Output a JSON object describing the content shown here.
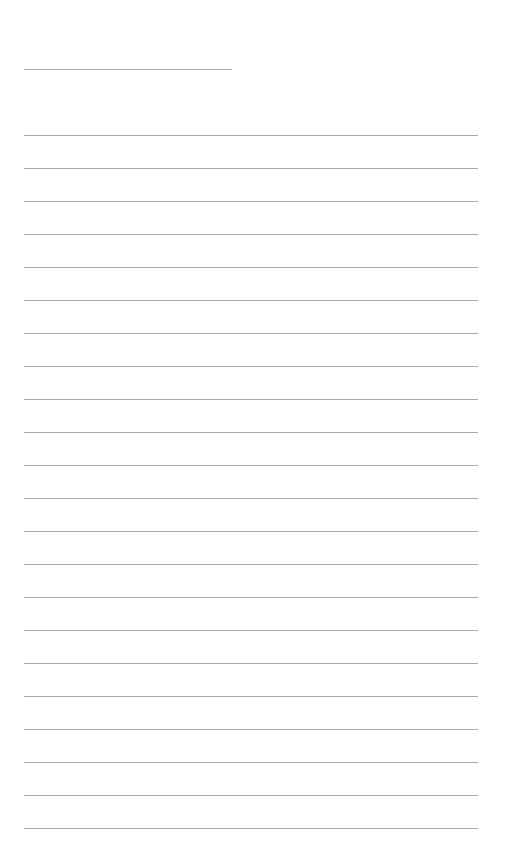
{
  "page": {
    "type": "blank lined paper",
    "header_line": {
      "x": 24,
      "y": 69,
      "width": 208
    },
    "ruled_lines": {
      "x": 24,
      "width": 454,
      "start_y": 135,
      "spacing": 33,
      "count": 22
    },
    "line_color": "#a9a9a9",
    "background": "#ffffff"
  }
}
